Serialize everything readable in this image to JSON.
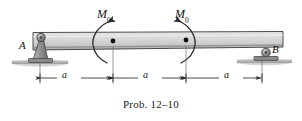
{
  "figure": {
    "caption": "Prob. 12–10",
    "type": "beam-loading-diagram"
  },
  "labels": {
    "moment_left": {
      "symbol": "M",
      "subscript": "0"
    },
    "moment_right": {
      "symbol": "M",
      "subscript": "0"
    },
    "support_a": "A",
    "support_b": "B"
  },
  "dimensions": [
    {
      "label": "a"
    },
    {
      "label": "a"
    },
    {
      "label": "a"
    }
  ],
  "supports": {
    "left": {
      "name": "A",
      "kind": "pin-support"
    },
    "right": {
      "name": "B",
      "kind": "roller-support"
    }
  },
  "colors": {
    "beam_fill": "#d3d3d3",
    "beam_stroke": "#3a3a3a",
    "support_fill": "#9a9a9a",
    "ground_fill": "#b4b4b4",
    "line": "#2b2b2b",
    "text": "#111111"
  }
}
